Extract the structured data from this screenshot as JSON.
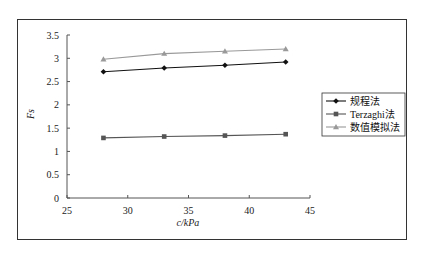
{
  "chart_data": {
    "type": "line",
    "title": "",
    "xlabel": "c/kPa",
    "ylabel": "Fs",
    "xlim": [
      25,
      45
    ],
    "ylim": [
      0,
      3.5
    ],
    "xticks": [
      "25",
      "30",
      "35",
      "40",
      "45"
    ],
    "yticks": [
      "0",
      "0.5",
      "1",
      "1.5",
      "2",
      "2.5",
      "3",
      "3.5"
    ],
    "grid": false,
    "legend_position": "right",
    "x": [
      28,
      33,
      38,
      43
    ],
    "series": [
      {
        "name": "规程法",
        "marker": "diamond",
        "color": "#111111",
        "values": [
          2.71,
          2.79,
          2.85,
          2.92
        ]
      },
      {
        "name": "Terzaghi法",
        "marker": "square",
        "color": "#555555",
        "values": [
          1.29,
          1.32,
          1.34,
          1.37
        ]
      },
      {
        "name": "数值模拟法",
        "marker": "triangle",
        "color": "#999999",
        "values": [
          2.98,
          3.1,
          3.15,
          3.2
        ]
      }
    ]
  }
}
